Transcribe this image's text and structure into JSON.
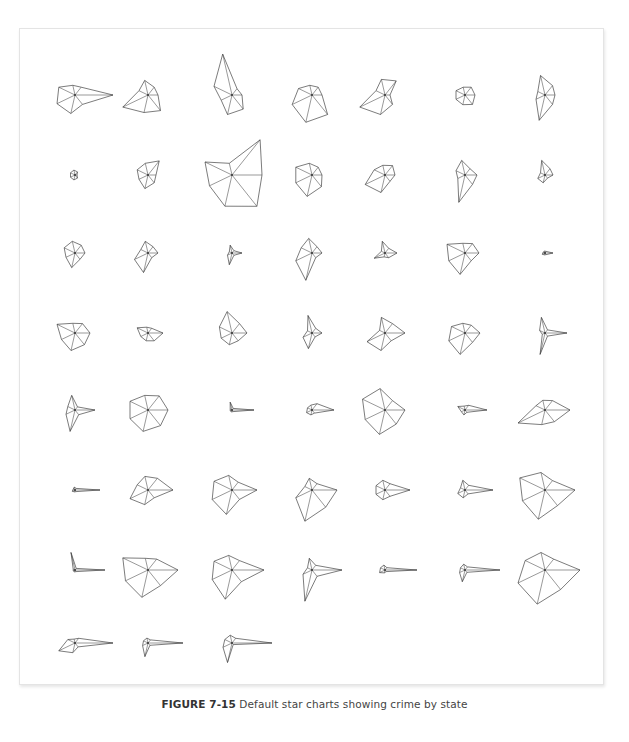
{
  "caption": {
    "label": "FIGURE 7-15",
    "text": "Default star charts showing crime by state"
  },
  "chart_data": {
    "type": "star",
    "title": "Default star charts showing crime by state",
    "layout": {
      "columns": 7,
      "rows": 8,
      "count": 51,
      "last_row_count": 3
    },
    "variables": 7,
    "ray_angles_deg": [
      0,
      51.43,
      102.86,
      154.29,
      205.71,
      257.14,
      308.57
    ],
    "max_radius_px": 42,
    "col_x": [
      75,
      148,
      232,
      312,
      385,
      465,
      545
    ],
    "row_y": [
      95,
      175,
      253,
      333,
      410,
      490,
      570,
      643
    ],
    "stars": [
      [
        38,
        10,
        10,
        18,
        20,
        19,
        12
      ],
      [
        10,
        10,
        15,
        10,
        28,
        18,
        20
      ],
      [
        10,
        8,
        42,
        20,
        12,
        20,
        18
      ],
      [
        10,
        10,
        10,
        15,
        22,
        28,
        25
      ],
      [
        5,
        18,
        16,
        10,
        28,
        20,
        12
      ],
      [
        10,
        10,
        8,
        10,
        10,
        10,
        12
      ],
      [
        10,
        12,
        20,
        8,
        10,
        26,
        12
      ],
      [
        2,
        4,
        5,
        5,
        5,
        5,
        4
      ],
      [
        8,
        18,
        12,
        12,
        10,
        14,
        10
      ],
      [
        30,
        45,
        12,
        30,
        25,
        32,
        40
      ],
      [
        10,
        10,
        12,
        18,
        18,
        22,
        15
      ],
      [
        10,
        12,
        10,
        12,
        22,
        18,
        8
      ],
      [
        12,
        8,
        15,
        10,
        8,
        28,
        12
      ],
      [
        8,
        8,
        15,
        5,
        8,
        8,
        4
      ],
      [
        10,
        10,
        12,
        12,
        10,
        15,
        8
      ],
      [
        10,
        8,
        12,
        8,
        15,
        20,
        6
      ],
      [
        10,
        3,
        8,
        3,
        5,
        12,
        3
      ],
      [
        10,
        8,
        15,
        12,
        18,
        28,
        6
      ],
      [
        12,
        6,
        12,
        4,
        12,
        4,
        6
      ],
      [
        14,
        12,
        10,
        20,
        18,
        22,
        10
      ],
      [
        8,
        2,
        2,
        2,
        3,
        2,
        2
      ],
      [
        15,
        12,
        10,
        20,
        15,
        18,
        15
      ],
      [
        15,
        6,
        6,
        12,
        8,
        8,
        10
      ],
      [
        15,
        12,
        22,
        14,
        12,
        12,
        10
      ],
      [
        10,
        6,
        18,
        5,
        10,
        16,
        5
      ],
      [
        20,
        12,
        16,
        6,
        20,
        18,
        10
      ],
      [
        15,
        10,
        10,
        15,
        18,
        22,
        12
      ],
      [
        22,
        4,
        16,
        6,
        3,
        22,
        4
      ],
      [
        20,
        4,
        15,
        8,
        10,
        22,
        6
      ],
      [
        20,
        18,
        15,
        20,
        20,
        22,
        20
      ],
      [
        22,
        2,
        8,
        2,
        2,
        2,
        2
      ],
      [
        22,
        8,
        5,
        5,
        6,
        5,
        4
      ],
      [
        20,
        12,
        22,
        25,
        22,
        25,
        18
      ],
      [
        22,
        6,
        4,
        8,
        4,
        5,
        3
      ],
      [
        25,
        12,
        10,
        10,
        30,
        15,
        15
      ],
      [
        25,
        2,
        3,
        2,
        3,
        2,
        2
      ],
      [
        25,
        15,
        14,
        12,
        20,
        15,
        10
      ],
      [
        25,
        10,
        15,
        20,
        22,
        25,
        12
      ],
      [
        25,
        8,
        12,
        8,
        18,
        32,
        22
      ],
      [
        25,
        8,
        10,
        10,
        10,
        10,
        8
      ],
      [
        28,
        6,
        10,
        5,
        8,
        8,
        5
      ],
      [
        30,
        12,
        18,
        28,
        25,
        30,
        20
      ],
      [
        30,
        2,
        18,
        2,
        2,
        2,
        2
      ],
      [
        30,
        14,
        12,
        28,
        25,
        28,
        20
      ],
      [
        32,
        12,
        15,
        20,
        22,
        30,
        15
      ],
      [
        30,
        6,
        12,
        5,
        10,
        32,
        8
      ],
      [
        32,
        3,
        5,
        5,
        6,
        3,
        2
      ],
      [
        35,
        4,
        6,
        5,
        6,
        12,
        3
      ],
      [
        35,
        14,
        18,
        22,
        30,
        35,
        25
      ],
      [
        38,
        6,
        4,
        8,
        18,
        10,
        5
      ],
      [
        35,
        4,
        5,
        5,
        6,
        14,
        3
      ],
      [
        40,
        6,
        8,
        8,
        10,
        20,
        2
      ]
    ]
  }
}
